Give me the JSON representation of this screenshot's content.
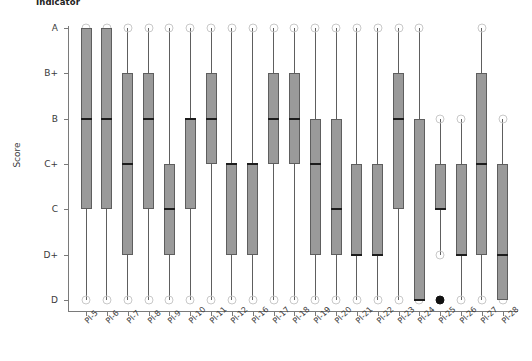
{
  "chart_data": {
    "type": "box",
    "title": "Indicator",
    "xlabel": "",
    "ylabel": "Score",
    "grid": false,
    "legend": null,
    "y_categories_top_to_bottom": [
      "A",
      "B+",
      "B",
      "C+",
      "C",
      "D+",
      "D"
    ],
    "y_scale_numeric": {
      "A": 7,
      "B+": 6,
      "B": 5,
      "C+": 4,
      "C": 3,
      "D+": 2,
      "D": 1
    },
    "categories": [
      "PI-5",
      "PI-6",
      "PI-7",
      "PI-8",
      "PI-9",
      "PI-10",
      "PI-11",
      "PI-12",
      "PI-16",
      "PI-17",
      "PI-18",
      "PI-19",
      "PI-20",
      "PI-21",
      "PI-22",
      "PI-23",
      "PI-24",
      "PI-25",
      "PI-26",
      "PI-27",
      "PI-28"
    ],
    "boxes": [
      {
        "category": "PI-5",
        "whisker_low": "D",
        "q1": "C",
        "median": "B",
        "q3": "A",
        "whisker_high": "A",
        "outliers": []
      },
      {
        "category": "PI-6",
        "whisker_low": "D",
        "q1": "C",
        "median": "B",
        "q3": "A",
        "whisker_high": "A",
        "outliers": []
      },
      {
        "category": "PI-7",
        "whisker_low": "D",
        "q1": "D+",
        "median": "C+",
        "q3": "B+",
        "whisker_high": "A",
        "outliers": []
      },
      {
        "category": "PI-8",
        "whisker_low": "D",
        "q1": "C",
        "median": "B",
        "q3": "B+",
        "whisker_high": "A",
        "outliers": []
      },
      {
        "category": "PI-9",
        "whisker_low": "D",
        "q1": "D+",
        "median": "C",
        "q3": "C+",
        "whisker_high": "A",
        "outliers": []
      },
      {
        "category": "PI-10",
        "whisker_low": "D",
        "q1": "C",
        "median": "B",
        "q3": "B",
        "whisker_high": "A",
        "outliers": []
      },
      {
        "category": "PI-11",
        "whisker_low": "D",
        "q1": "C+",
        "median": "B",
        "q3": "B+",
        "whisker_high": "A",
        "outliers": []
      },
      {
        "category": "PI-12",
        "whisker_low": "D",
        "q1": "D+",
        "median": "C+",
        "q3": "C+",
        "whisker_high": "A",
        "outliers": []
      },
      {
        "category": "PI-16",
        "whisker_low": "D",
        "q1": "D+",
        "median": "C+",
        "q3": "C+",
        "whisker_high": "A",
        "outliers": []
      },
      {
        "category": "PI-17",
        "whisker_low": "D",
        "q1": "C+",
        "median": "B",
        "q3": "B+",
        "whisker_high": "A",
        "outliers": []
      },
      {
        "category": "PI-18",
        "whisker_low": "D",
        "q1": "C+",
        "median": "B",
        "q3": "B+",
        "whisker_high": "A",
        "outliers": []
      },
      {
        "category": "PI-19",
        "whisker_low": "D",
        "q1": "D+",
        "median": "C+",
        "q3": "B",
        "whisker_high": "A",
        "outliers": []
      },
      {
        "category": "PI-20",
        "whisker_low": "D",
        "q1": "D+",
        "median": "C",
        "q3": "B",
        "whisker_high": "A",
        "outliers": []
      },
      {
        "category": "PI-21",
        "whisker_low": "D",
        "q1": "D+",
        "median": "D+",
        "q3": "C+",
        "whisker_high": "A",
        "outliers": []
      },
      {
        "category": "PI-22",
        "whisker_low": "D",
        "q1": "D+",
        "median": "D+",
        "q3": "C+",
        "whisker_high": "A",
        "outliers": []
      },
      {
        "category": "PI-23",
        "whisker_low": "D",
        "q1": "C",
        "median": "B",
        "q3": "B+",
        "whisker_high": "A",
        "outliers": []
      },
      {
        "category": "PI-24",
        "whisker_low": "D",
        "q1": "D",
        "median": "D",
        "q3": "B",
        "whisker_high": "A",
        "outliers": []
      },
      {
        "category": "PI-25",
        "whisker_low": "D+",
        "q1": "C",
        "median": "C",
        "q3": "C+",
        "whisker_high": "B",
        "outliers": [
          "D"
        ]
      },
      {
        "category": "PI-26",
        "whisker_low": "D",
        "q1": "D+",
        "median": "D+",
        "q3": "C+",
        "whisker_high": "B",
        "outliers": []
      },
      {
        "category": "PI-27",
        "whisker_low": "D",
        "q1": "D+",
        "median": "C+",
        "q3": "B+",
        "whisker_high": "A",
        "outliers": []
      },
      {
        "category": "PI-28",
        "whisker_low": "D",
        "q1": "D",
        "median": "D+",
        "q3": "C+",
        "whisker_high": "B",
        "outliers": []
      }
    ],
    "colors": {
      "box_fill": "#9a9a9a",
      "box_edge": "#5e5e5e",
      "median": "#1d1d1d",
      "whisker": "#5e5e5e",
      "cap": "#c9c9c9",
      "outlier": "#111111",
      "axis": "#7a7a7a",
      "text": "#3a3a3a"
    }
  }
}
